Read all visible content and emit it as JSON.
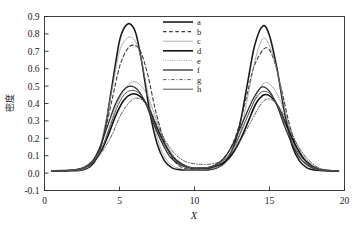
{
  "chart_data": {
    "type": "line",
    "title": "",
    "xlabel": "X",
    "ylabel": "密度",
    "xlim": [
      0,
      20
    ],
    "ylim": [
      -0.1,
      0.9
    ],
    "xticks": [
      "0",
      "5",
      "10",
      "15",
      "20"
    ],
    "xtick_values": [
      0,
      5,
      10,
      15,
      20
    ],
    "yticks": [
      "-0.1",
      "0.0",
      "0.1",
      "0.2",
      "0.3",
      "0.4",
      "0.5",
      "0.6",
      "0.7",
      "0.8",
      "0.9"
    ],
    "ytick_values": [
      -0.1,
      0.0,
      0.1,
      0.2,
      0.3,
      0.4,
      0.5,
      0.6,
      0.7,
      0.8,
      0.9
    ],
    "grid": false,
    "legend_position": "top-right",
    "legend_entries": [
      {
        "label": "a",
        "dash": "none",
        "width": 1.6,
        "color": "#1a1a1a"
      },
      {
        "label": "b",
        "dash": "dashed",
        "width": 1.1,
        "color": "#3a3a3a"
      },
      {
        "label": "c",
        "dash": "none",
        "width": 0.7,
        "color": "#8c8c8c"
      },
      {
        "label": "d",
        "dash": "none",
        "width": 1.6,
        "color": "#111111"
      },
      {
        "label": "e",
        "dash": "dotted",
        "width": 0.8,
        "color": "#6e6e6e"
      },
      {
        "label": "f",
        "dash": "none",
        "width": 1.3,
        "color": "#2f2f2f"
      },
      {
        "label": "g",
        "dash": "dashdot",
        "width": 0.9,
        "color": "#4d4d4d"
      },
      {
        "label": "h",
        "dash": "none",
        "width": 1.0,
        "color": "#555555"
      }
    ],
    "series": [
      {
        "name": "a",
        "peak1_x": 5.75,
        "peak1_y": 0.855,
        "peak2_x": 14.55,
        "peak2_y": 0.845,
        "x": [
          0.5,
          1.0,
          1.5,
          2.0,
          2.5,
          3.0,
          3.5,
          4.0,
          4.5,
          5.0,
          5.4,
          5.75,
          6.1,
          6.5,
          7.0,
          7.5,
          8.0,
          8.5,
          9.0,
          9.5,
          10.0,
          10.5,
          11.0,
          11.5,
          12.0,
          12.5,
          13.0,
          13.5,
          14.0,
          14.55,
          15.0,
          15.5,
          16.0,
          16.5,
          17.0,
          17.5,
          18.0,
          19.0,
          19.6
        ],
        "y": [
          0.012,
          0.012,
          0.013,
          0.014,
          0.018,
          0.035,
          0.09,
          0.24,
          0.5,
          0.76,
          0.845,
          0.855,
          0.8,
          0.63,
          0.36,
          0.17,
          0.07,
          0.03,
          0.02,
          0.018,
          0.018,
          0.018,
          0.02,
          0.03,
          0.06,
          0.13,
          0.27,
          0.5,
          0.73,
          0.845,
          0.79,
          0.6,
          0.35,
          0.16,
          0.07,
          0.03,
          0.018,
          0.012,
          0.011
        ]
      },
      {
        "name": "b",
        "peak1_x": 5.95,
        "peak1_y": 0.735,
        "peak2_x": 14.75,
        "peak2_y": 0.72,
        "x": [
          0.5,
          1.0,
          1.5,
          2.0,
          2.5,
          3.0,
          3.5,
          4.0,
          4.5,
          5.0,
          5.5,
          5.95,
          6.4,
          6.9,
          7.4,
          8.0,
          8.5,
          9.0,
          9.5,
          10.0,
          10.5,
          11.0,
          11.5,
          12.0,
          12.5,
          13.0,
          13.5,
          14.0,
          14.75,
          15.3,
          15.8,
          16.3,
          16.8,
          17.4,
          18.0,
          19.0,
          19.6
        ],
        "y": [
          0.012,
          0.012,
          0.013,
          0.015,
          0.02,
          0.04,
          0.1,
          0.23,
          0.42,
          0.61,
          0.71,
          0.735,
          0.7,
          0.56,
          0.36,
          0.18,
          0.09,
          0.04,
          0.025,
          0.02,
          0.022,
          0.03,
          0.05,
          0.09,
          0.16,
          0.28,
          0.45,
          0.62,
          0.72,
          0.65,
          0.48,
          0.29,
          0.15,
          0.07,
          0.03,
          0.013,
          0.011
        ]
      },
      {
        "name": "c",
        "peak1_x": 5.8,
        "peak1_y": 0.78,
        "peak2_x": 14.6,
        "peak2_y": 0.775,
        "x": [
          0.5,
          1.0,
          1.5,
          2.0,
          2.5,
          3.0,
          3.5,
          4.0,
          4.5,
          5.0,
          5.45,
          5.8,
          6.2,
          6.6,
          7.1,
          7.6,
          8.1,
          8.6,
          9.2,
          9.8,
          10.4,
          11.0,
          11.6,
          12.1,
          12.6,
          13.1,
          13.6,
          14.1,
          14.6,
          15.1,
          15.6,
          16.1,
          16.6,
          17.2,
          17.8,
          18.6,
          19.6
        ],
        "y": [
          0.012,
          0.012,
          0.013,
          0.015,
          0.02,
          0.04,
          0.1,
          0.26,
          0.48,
          0.7,
          0.77,
          0.78,
          0.73,
          0.59,
          0.36,
          0.18,
          0.08,
          0.04,
          0.022,
          0.018,
          0.018,
          0.022,
          0.035,
          0.06,
          0.12,
          0.25,
          0.46,
          0.67,
          0.775,
          0.71,
          0.55,
          0.33,
          0.16,
          0.07,
          0.03,
          0.014,
          0.011
        ]
      },
      {
        "name": "d",
        "peak1_x": 5.85,
        "peak1_y": 0.455,
        "peak2_x": 14.65,
        "peak2_y": 0.45,
        "x": [
          0.5,
          1.2,
          2.0,
          2.6,
          3.2,
          3.8,
          4.3,
          4.8,
          5.3,
          5.85,
          6.4,
          6.9,
          7.4,
          8.0,
          8.6,
          9.2,
          9.8,
          10.4,
          11.0,
          11.6,
          12.1,
          12.6,
          13.1,
          13.6,
          14.1,
          14.65,
          15.2,
          15.7,
          16.2,
          16.8,
          17.4,
          18.2,
          19.0,
          19.6
        ],
        "y": [
          0.013,
          0.014,
          0.018,
          0.03,
          0.06,
          0.13,
          0.23,
          0.34,
          0.42,
          0.455,
          0.44,
          0.38,
          0.28,
          0.17,
          0.09,
          0.05,
          0.03,
          0.028,
          0.03,
          0.045,
          0.07,
          0.12,
          0.2,
          0.3,
          0.4,
          0.45,
          0.43,
          0.36,
          0.26,
          0.15,
          0.07,
          0.025,
          0.014,
          0.012
        ]
      },
      {
        "name": "e",
        "peak1_x": 5.9,
        "peak1_y": 0.525,
        "peak2_x": 14.7,
        "peak2_y": 0.52,
        "x": [
          0.5,
          1.2,
          2.0,
          2.6,
          3.2,
          3.8,
          4.3,
          4.8,
          5.35,
          5.9,
          6.45,
          6.95,
          7.45,
          8.0,
          8.6,
          9.2,
          9.8,
          10.4,
          11.0,
          11.6,
          12.1,
          12.6,
          13.1,
          13.65,
          14.2,
          14.7,
          15.25,
          15.75,
          16.25,
          16.85,
          17.45,
          18.2,
          19.0,
          19.6
        ],
        "y": [
          0.013,
          0.014,
          0.018,
          0.03,
          0.06,
          0.14,
          0.26,
          0.39,
          0.48,
          0.525,
          0.5,
          0.43,
          0.31,
          0.19,
          0.1,
          0.05,
          0.032,
          0.03,
          0.032,
          0.05,
          0.08,
          0.14,
          0.23,
          0.35,
          0.46,
          0.52,
          0.49,
          0.41,
          0.29,
          0.16,
          0.08,
          0.027,
          0.014,
          0.012
        ]
      },
      {
        "name": "f",
        "peak1_x": 5.7,
        "peak1_y": 0.5,
        "peak2_x": 14.5,
        "peak2_y": 0.495,
        "x": [
          0.5,
          1.2,
          2.0,
          2.6,
          3.2,
          3.7,
          4.2,
          4.7,
          5.2,
          5.7,
          6.2,
          6.7,
          7.2,
          7.8,
          8.4,
          9.0,
          9.6,
          10.2,
          10.8,
          11.4,
          11.9,
          12.4,
          12.9,
          13.45,
          14.0,
          14.5,
          15.0,
          15.5,
          16.0,
          16.6,
          17.2,
          18.0,
          19.0,
          19.6
        ],
        "y": [
          0.013,
          0.014,
          0.018,
          0.032,
          0.07,
          0.15,
          0.27,
          0.39,
          0.47,
          0.5,
          0.48,
          0.41,
          0.3,
          0.18,
          0.09,
          0.05,
          0.03,
          0.028,
          0.03,
          0.048,
          0.08,
          0.14,
          0.23,
          0.34,
          0.44,
          0.495,
          0.47,
          0.39,
          0.27,
          0.15,
          0.07,
          0.025,
          0.014,
          0.012
        ]
      },
      {
        "name": "g",
        "peak1_x": 6.0,
        "peak1_y": 0.43,
        "peak2_x": 14.8,
        "peak2_y": 0.425,
        "x": [
          0.5,
          1.2,
          2.0,
          2.7,
          3.3,
          3.9,
          4.5,
          5.0,
          5.5,
          6.0,
          6.5,
          7.0,
          7.5,
          8.1,
          8.7,
          9.3,
          9.9,
          10.5,
          11.1,
          11.7,
          12.2,
          12.7,
          13.2,
          13.8,
          14.3,
          14.8,
          15.35,
          15.85,
          16.35,
          16.95,
          17.55,
          18.3,
          19.1,
          19.6
        ],
        "y": [
          0.013,
          0.014,
          0.019,
          0.032,
          0.065,
          0.13,
          0.22,
          0.32,
          0.39,
          0.43,
          0.42,
          0.37,
          0.28,
          0.18,
          0.11,
          0.07,
          0.055,
          0.05,
          0.052,
          0.065,
          0.09,
          0.14,
          0.21,
          0.3,
          0.38,
          0.425,
          0.41,
          0.35,
          0.25,
          0.15,
          0.08,
          0.03,
          0.015,
          0.012
        ]
      },
      {
        "name": "h",
        "peak1_x": 5.78,
        "peak1_y": 0.475,
        "peak2_x": 14.58,
        "peak2_y": 0.47,
        "x": [
          0.5,
          1.2,
          2.0,
          2.6,
          3.2,
          3.8,
          4.3,
          4.8,
          5.3,
          5.78,
          6.3,
          6.8,
          7.3,
          7.9,
          8.5,
          9.1,
          9.7,
          10.3,
          10.9,
          11.5,
          12.0,
          12.5,
          13.0,
          13.55,
          14.1,
          14.58,
          15.1,
          15.6,
          16.1,
          16.7,
          17.3,
          18.1,
          19.0,
          19.6
        ],
        "y": [
          0.013,
          0.014,
          0.018,
          0.031,
          0.065,
          0.14,
          0.25,
          0.37,
          0.45,
          0.475,
          0.46,
          0.4,
          0.29,
          0.18,
          0.095,
          0.05,
          0.032,
          0.029,
          0.032,
          0.05,
          0.08,
          0.13,
          0.22,
          0.33,
          0.43,
          0.47,
          0.45,
          0.38,
          0.27,
          0.15,
          0.075,
          0.026,
          0.014,
          0.012
        ]
      }
    ]
  },
  "figure": {
    "background": "#ffffff",
    "axis_color": "#2b2b2b"
  }
}
